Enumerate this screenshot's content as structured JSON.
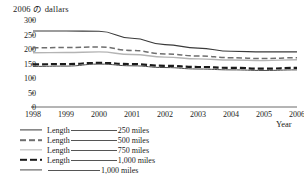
{
  "chart": {
    "y_axis_title": "2006 の dallars",
    "x_axis_title": "Year"
  },
  "chart_data": {
    "type": "line",
    "title": "2006 の dallars",
    "xlabel": "Year",
    "ylabel": "2006 の dallars",
    "x": [
      1998,
      1999,
      2000,
      2001,
      2002,
      2003,
      2004,
      2005,
      2006
    ],
    "xlim": [
      1998,
      2006
    ],
    "ylim": [
      0,
      300
    ],
    "yticks": [
      0,
      50,
      100,
      150,
      200,
      250,
      300
    ],
    "xticks": [
      1998,
      1999,
      2000,
      2001,
      2002,
      2003,
      2004,
      2005,
      2006
    ],
    "grid": false,
    "legend_position": "below",
    "series": [
      {
        "name": "Length ______ 250 miles",
        "style": "solid-dark",
        "values": [
          262,
          262,
          261,
          237,
          215,
          203,
          192,
          190,
          190
        ]
      },
      {
        "name": "Length ______ 500 miles",
        "style": "dash-gray",
        "values": [
          204,
          205,
          207,
          195,
          183,
          176,
          170,
          167,
          170
        ]
      },
      {
        "name": "Length ______ 750 miles",
        "style": "solid-light",
        "values": [
          187,
          188,
          190,
          181,
          172,
          166,
          162,
          160,
          163
        ]
      },
      {
        "name": "Length ______ 1,000 miles",
        "style": "dash-bold",
        "values": [
          147,
          148,
          152,
          148,
          142,
          138,
          135,
          132,
          135
        ]
      },
      {
        "name": "______ 1,000 miles",
        "style": "solid-plain",
        "values": [
          140,
          141,
          148,
          142,
          136,
          131,
          128,
          126,
          128
        ]
      }
    ]
  },
  "y_ticks": [
    {
      "label": "300",
      "value": 300
    },
    {
      "label": "250",
      "value": 250
    },
    {
      "label": "200",
      "value": 200
    },
    {
      "label": "150",
      "value": 150
    },
    {
      "label": "100",
      "value": 100
    },
    {
      "label": "50",
      "value": 50
    },
    {
      "label": "0",
      "value": 0
    }
  ],
  "x_ticks": [
    {
      "label": "1998"
    },
    {
      "label": "1999"
    },
    {
      "label": "2000"
    },
    {
      "label": "2001"
    },
    {
      "label": "2002"
    },
    {
      "label": "2003"
    },
    {
      "label": "2004"
    },
    {
      "label": "2005"
    },
    {
      "label": "2006"
    }
  ],
  "legend": {
    "rows": [
      {
        "style": "s-solid-dark",
        "name": "Length",
        "value": "250 miles",
        "wide": false
      },
      {
        "style": "s-dash-gray",
        "name": "Length",
        "value": "500 miles",
        "wide": false
      },
      {
        "style": "s-solid-light",
        "name": "Length",
        "value": "750 miles",
        "wide": false
      },
      {
        "style": "s-dash-bold",
        "name": "Length",
        "value": "1,000 miles",
        "wide": false
      },
      {
        "style": "s-solid-plain",
        "name": "",
        "value": "1,000 miles",
        "wide": true
      }
    ]
  },
  "colors": {
    "line_dark": "#3a3a3a",
    "line_gray": "#6e6e6e",
    "line_light": "#b4b4b4",
    "line_bold": "#1a1a1a",
    "axis": "#444444",
    "text": "#222222"
  }
}
